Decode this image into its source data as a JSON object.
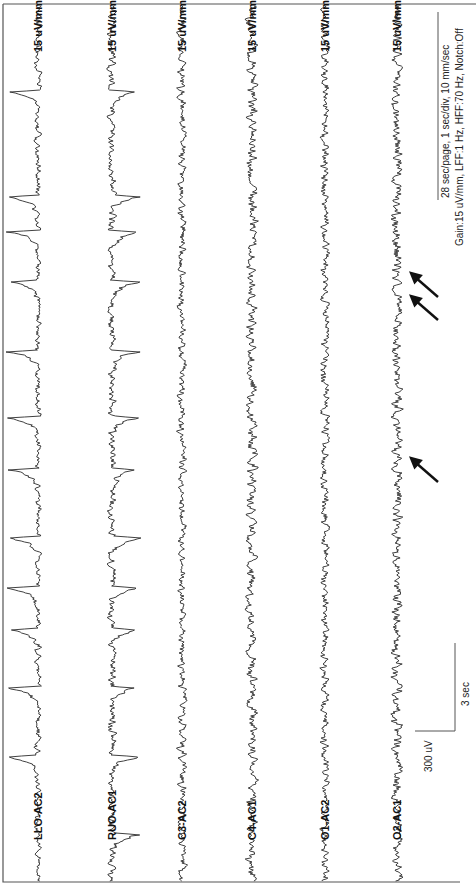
{
  "chart_data": {
    "type": "line",
    "title": "",
    "orientation": "rotated-90-clockwise (time runs bottom to top, channels left to right)",
    "recording_info": {
      "line1": "28 sec/page, 1 sec/div, 10 mm/sec",
      "line2": "Gain:15 uV/mm, LFF:1 Hz, HFF:70 Hz, Notch:Off"
    },
    "scale_bar": {
      "amplitude_label": "300 uV",
      "time_label": "3 sec"
    },
    "duration_sec": 28,
    "channels": [
      {
        "name": "LLO-AC2",
        "gain_label": "15 uV/mm",
        "baseline_x": 38,
        "character": "large slow eye-movement deflections",
        "deflection_dir": -1,
        "deflection_amp": 30,
        "noise": 3,
        "events_y": [
          92,
          197,
          232,
          282,
          352,
          418,
          470,
          538,
          588,
          630,
          688,
          757
        ]
      },
      {
        "name": "RUO-AC1",
        "gain_label": "15 uV/mm",
        "baseline_x": 112,
        "character": "opposite-polarity eye-movement deflections",
        "deflection_dir": 1,
        "deflection_amp": 26,
        "noise": 4,
        "events_y": [
          92,
          197,
          232,
          282,
          352,
          418,
          470,
          538,
          588,
          630,
          688,
          757,
          835
        ]
      },
      {
        "name": "C3-AC2",
        "gain_label": "15 uV/mm",
        "baseline_x": 182,
        "character": "low-amplitude background",
        "deflection_dir": 0,
        "deflection_amp": 0,
        "noise": 4,
        "events_y": []
      },
      {
        "name": "C4-AC1",
        "gain_label": "15 uV/mm",
        "baseline_x": 252,
        "character": "fast low-amplitude activity",
        "deflection_dir": 0,
        "deflection_amp": 0,
        "noise": 5,
        "events_y": []
      },
      {
        "name": "O1-AC2",
        "gain_label": "15 uV/mm",
        "baseline_x": 325,
        "character": "low-amplitude background",
        "deflection_dir": 0,
        "deflection_amp": 0,
        "noise": 4,
        "events_y": []
      },
      {
        "name": "O2-AC1",
        "gain_label": "15 uV/mm",
        "baseline_x": 397,
        "character": "fast activity with sharp transients",
        "deflection_dir": 0,
        "deflection_amp": 0,
        "noise": 5,
        "events_y": []
      }
    ],
    "annotations": [
      {
        "type": "arrow",
        "channel": "O2-AC1",
        "tip": [
          411,
          273
        ],
        "tail": [
          438,
          297
        ]
      },
      {
        "type": "arrow",
        "channel": "O2-AC1",
        "tip": [
          411,
          296
        ],
        "tail": [
          438,
          320
        ]
      },
      {
        "type": "arrow",
        "channel": "O2-AC1",
        "tip": [
          411,
          458
        ],
        "tail": [
          438,
          482
        ]
      }
    ],
    "grid": false,
    "legend": "none"
  }
}
